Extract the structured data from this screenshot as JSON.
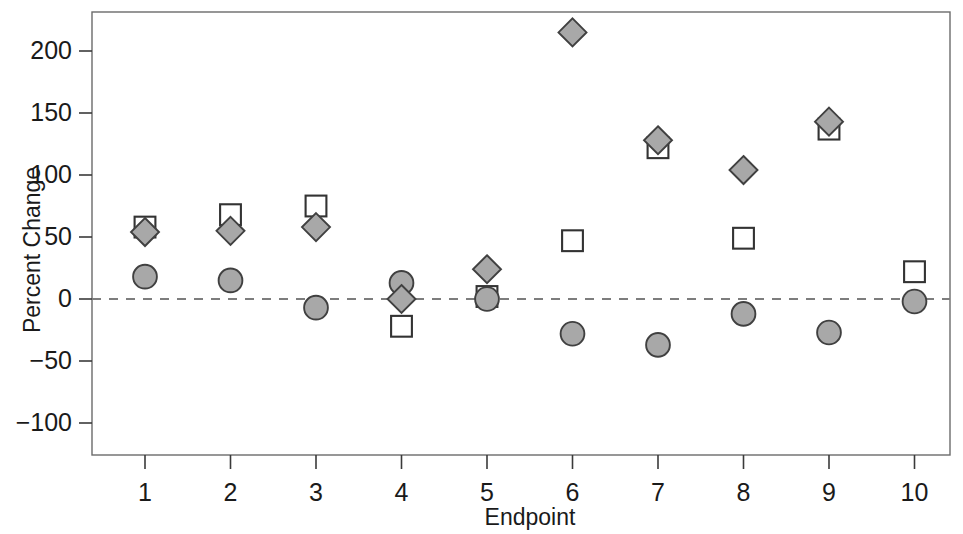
{
  "chart_data": {
    "type": "scatter",
    "title": "",
    "xlabel": "Endpoint",
    "ylabel": "Percent Change",
    "categories": [
      "1",
      "2",
      "3",
      "4",
      "5",
      "6",
      "7",
      "8",
      "9",
      "10"
    ],
    "x": [
      1,
      2,
      3,
      4,
      5,
      6,
      7,
      8,
      9,
      10
    ],
    "xlim": [
      0.55,
      10.45
    ],
    "ylim": [
      -118,
      222
    ],
    "yticks": [
      200,
      150,
      100,
      50,
      0,
      -50,
      -100
    ],
    "ytick_labels": [
      "200",
      "150",
      "100",
      "50",
      "0",
      "−50",
      "−100"
    ],
    "xticks": [
      1,
      2,
      3,
      4,
      5,
      6,
      7,
      8,
      9,
      10
    ],
    "xtick_labels": [
      "1",
      "2",
      "3",
      "4",
      "5",
      "6",
      "7",
      "8",
      "9",
      "10"
    ],
    "grid": false,
    "legend": "none",
    "annotations": [
      {
        "name": "zero-reference-line",
        "type": "hline",
        "y": 0,
        "style": "dashed"
      }
    ],
    "series": [
      {
        "name": "diamond-series",
        "marker": "diamond",
        "fill": "#a8a8a8",
        "stroke": "#404040",
        "x": [
          1,
          2,
          3,
          4,
          5,
          6,
          7,
          8,
          9
        ],
        "values": [
          54,
          55,
          58,
          0,
          24,
          215,
          128,
          104,
          143
        ]
      },
      {
        "name": "square-series",
        "marker": "square-open",
        "fill": "#ffffff",
        "stroke": "#333333",
        "x": [
          1,
          2,
          3,
          4,
          5,
          6,
          7,
          8,
          9,
          10
        ],
        "values": [
          58,
          68,
          75,
          -22,
          2,
          47,
          122,
          49,
          137,
          22
        ]
      },
      {
        "name": "circle-series",
        "marker": "circle",
        "fill": "#a8a8a8",
        "stroke": "#404040",
        "x": [
          1,
          2,
          3,
          4,
          5,
          6,
          7,
          8,
          9,
          10
        ],
        "values": [
          18,
          15,
          -7,
          13,
          0,
          -28,
          -37,
          -12,
          -27,
          -2
        ]
      }
    ]
  },
  "figure": {
    "axis_color": "#6b6b6b",
    "text_color": "#1a1a1a",
    "background": "#ffffff",
    "cropped_title_fragment": ""
  }
}
